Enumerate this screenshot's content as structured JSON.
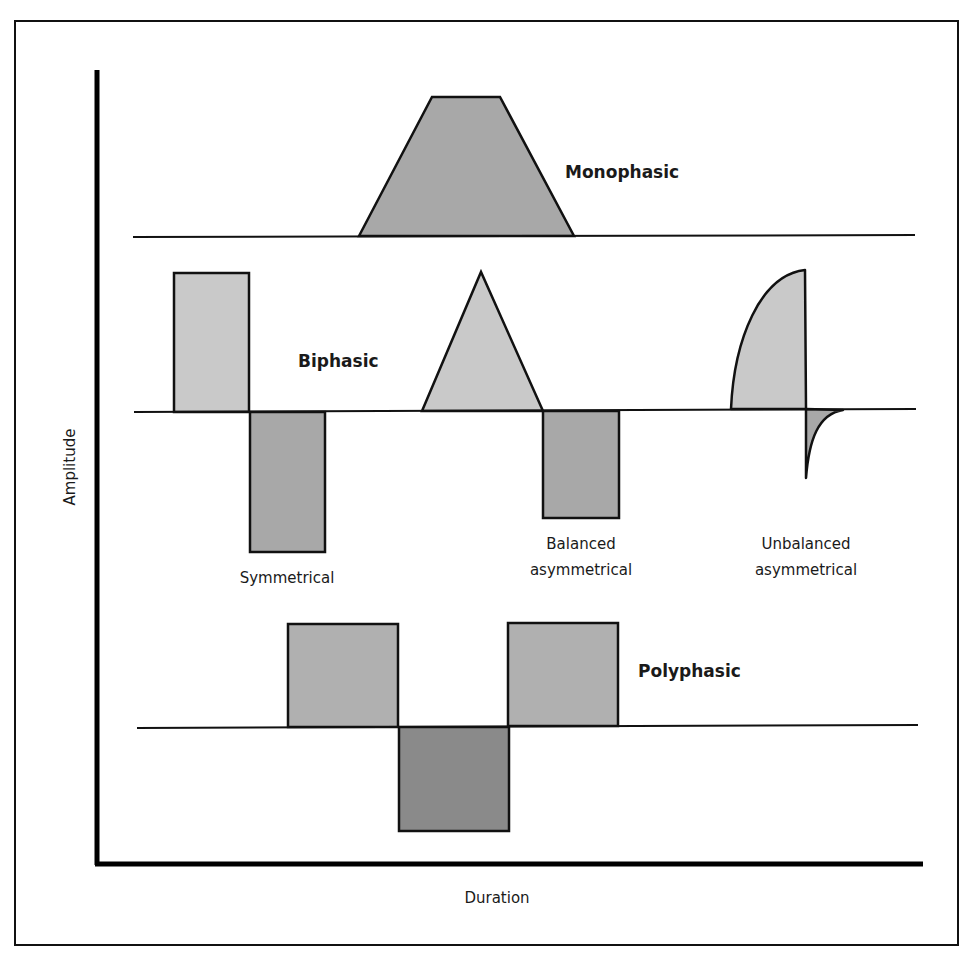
{
  "figure": {
    "axes": {
      "ylabel": "Amplitude",
      "xlabel": "Duration"
    },
    "colors": {
      "light_fill": "#c9c9c9",
      "medium_fill": "#a8a8a8",
      "dark_fill": "#8c8c8c",
      "stroke": "#111111"
    },
    "sections": {
      "monophasic": {
        "title": "Monophasic"
      },
      "biphasic": {
        "title": "Biphasic",
        "variants": [
          {
            "label_line1": "Symmetrical",
            "label_line2": ""
          },
          {
            "label_line1": "Balanced",
            "label_line2": "asymmetrical"
          },
          {
            "label_line1": "Unbalanced",
            "label_line2": "asymmetrical"
          }
        ]
      },
      "polyphasic": {
        "title": "Polyphasic"
      }
    }
  }
}
